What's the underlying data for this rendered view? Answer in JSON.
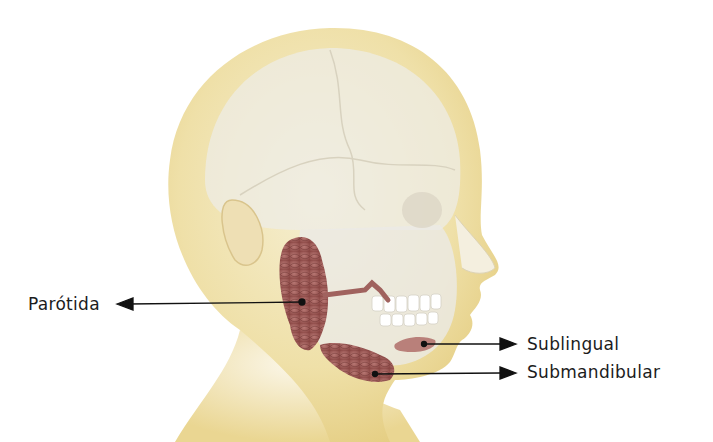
{
  "diagram": {
    "labels": [
      {
        "id": "parotid",
        "text": "Parótida",
        "side": "left"
      },
      {
        "id": "sublingual",
        "text": "Sublingual",
        "side": "right"
      },
      {
        "id": "submandibular",
        "text": "Submandibular",
        "side": "right"
      }
    ],
    "colors": {
      "skin": "#f1e3b0",
      "skin_shadow": "#e4cf85",
      "skull": "#ebe9e2",
      "gland": "#9a5552",
      "gland_light": "#b87874",
      "arrow": "#111111"
    }
  }
}
